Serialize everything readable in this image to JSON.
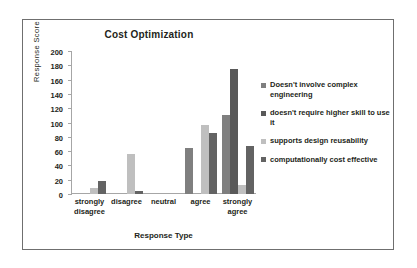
{
  "figure": {
    "title": "Cost Optimization"
  },
  "chart_data": {
    "type": "bar",
    "title": "Cost Optimization",
    "xlabel": "Response Type",
    "ylabel": "Response Score",
    "categories": [
      "strongly disagree",
      "disagree",
      "neutral",
      "agree",
      "strongly agree"
    ],
    "category_lines": [
      [
        "strongly",
        "disagree"
      ],
      [
        "disagree",
        ""
      ],
      [
        "neutral",
        ""
      ],
      [
        "agree",
        ""
      ],
      [
        "strongly",
        "agree"
      ]
    ],
    "ylim": [
      0,
      200
    ],
    "yticks": [
      0,
      20,
      40,
      60,
      80,
      100,
      120,
      140,
      160,
      180,
      200
    ],
    "ytick_labels": [
      "0",
      "20",
      "40",
      "60",
      "80",
      "100",
      "120",
      "140",
      "160",
      "180",
      "200"
    ],
    "grid": false,
    "legend_position": "right",
    "series": [
      {
        "name": "Doesn't involve complex engineering",
        "color": "#7f7f7f",
        "values": [
          0,
          0,
          0,
          64,
          110
        ]
      },
      {
        "name": "doesn't require higher skill to use it",
        "color": "#595959",
        "values": [
          0,
          0,
          0,
          0,
          175
        ]
      },
      {
        "name": "supports design reusability",
        "color": "#bfbfbf",
        "values": [
          9,
          56,
          0,
          96,
          12
        ]
      },
      {
        "name": "computationally cost effective",
        "color": "#636363",
        "values": [
          18,
          4,
          0,
          86,
          67
        ]
      }
    ]
  },
  "legend": {
    "items": [
      {
        "label": "Doesn't involve complex engineering",
        "color": "#7f7f7f"
      },
      {
        "label": "doesn't require higher skill to use it",
        "color": "#595959"
      },
      {
        "label": "supports design reusability",
        "color": "#bfbfbf"
      },
      {
        "label": "computationally cost effective",
        "color": "#636363"
      }
    ]
  }
}
